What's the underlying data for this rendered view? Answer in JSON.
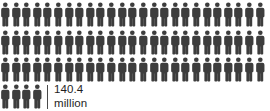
{
  "chart_data": {
    "type": "pictogram",
    "title": "",
    "subtitle": "",
    "xlabel": "",
    "ylabel": "",
    "icon_name": "person-icon",
    "icon_color": "#3d3d3d",
    "background_color": "#ffffff",
    "text_color": "#1e1e1e",
    "icons_per_row": 25,
    "total_icons": 79,
    "full_rows": 3,
    "partial_row_icons": 4,
    "rows": [
      25,
      25,
      25,
      4
    ],
    "categories": [
      "140.4 million"
    ],
    "values": [
      140.4
    ],
    "value_per_icon": 1.777,
    "annotations": [
      {
        "name": "value-label",
        "number": "140.4",
        "unit": "million",
        "marker": "tick-mark"
      }
    ],
    "legend": [],
    "grid": false
  },
  "label": {
    "number": "140.4",
    "unit": "million"
  },
  "icon": {
    "semantic_name": "person-icon",
    "color": "#3d3d3d"
  }
}
